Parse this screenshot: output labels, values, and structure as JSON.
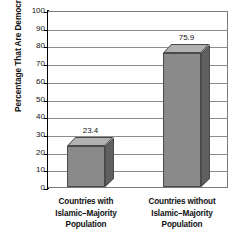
{
  "chart_data": {
    "type": "bar",
    "title": "",
    "subtitle": "",
    "xlabel": "",
    "ylabel": "Percentage That Are Democratic",
    "categories": [
      "Countries with Islamic–Majority Population",
      "Countries without Islamic–Majority Population"
    ],
    "category_lines": [
      [
        "Countries with",
        "Islamic–Majority",
        "Population"
      ],
      [
        "Countries without",
        "Islamic–Majority",
        "Population"
      ]
    ],
    "values": [
      23.4,
      75.9
    ],
    "value_labels": [
      "23.4",
      "75.9"
    ],
    "ylim": [
      0,
      100
    ],
    "ytick_step": 10,
    "yticks": [
      100,
      90,
      80,
      70,
      60,
      50,
      40,
      30,
      20,
      10,
      0
    ],
    "ytick_labels": [
      "100",
      "90",
      "80",
      "70",
      "60",
      "50",
      "40",
      "30",
      "20",
      "10",
      "0"
    ],
    "grid": true,
    "grid_axis": "y",
    "legend": false,
    "legend_position": "none",
    "style": "3d-column",
    "colors": {
      "bar_front": "#8a8a8a",
      "bar_top": "#b2b2b2",
      "bar_side": "#606060",
      "bar_outline": "#4a4a4a",
      "gridline": "#8d8d8d",
      "axis": "#000000",
      "frame": "#7b7b7b",
      "text": "#111111",
      "background": "#ffffff"
    }
  }
}
